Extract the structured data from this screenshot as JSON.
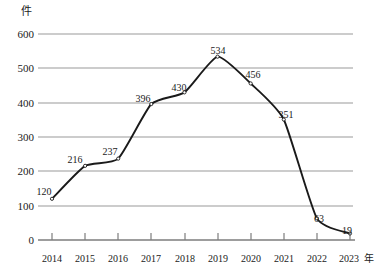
{
  "chart_data": {
    "type": "line",
    "title": "",
    "subtitle": "",
    "xlabel": "年",
    "ylabel": "件",
    "unit_label": "件",
    "x_axis_unit": "年",
    "categories": [
      "2014",
      "2015",
      "2016",
      "2017",
      "2018",
      "2019",
      "2020",
      "2021",
      "2022",
      "2023"
    ],
    "x": [
      2014,
      2015,
      2016,
      2017,
      2018,
      2019,
      2020,
      2021,
      2022,
      2023
    ],
    "values": [
      120,
      216,
      237,
      396,
      430,
      534,
      456,
      351,
      63,
      19
    ],
    "point_labels": [
      "120",
      "216",
      "237",
      "396",
      "430",
      "534",
      "456",
      "351",
      "63",
      "19"
    ],
    "ylim": [
      0,
      600
    ],
    "y_ticks": [
      0,
      100,
      200,
      300,
      400,
      500,
      600
    ],
    "y_tick_labels": [
      "0",
      "100",
      "200",
      "300",
      "400",
      "500",
      "600"
    ],
    "grid": true,
    "grid_axis": "y",
    "legend": "none",
    "legend_position": "none",
    "smoothing": "spline",
    "line_color": "#1a1a1a",
    "grid_color": "#9a9a9a",
    "axis_color": "#7d7d7d",
    "marker": "open-circle",
    "marker_color": "#ffffff"
  },
  "colors": {
    "background": "#ffffff",
    "line": "#1a1a1a",
    "grid": "#9a9a9a",
    "axis": "#7d7d7d",
    "text": "#1a1a1a"
  }
}
